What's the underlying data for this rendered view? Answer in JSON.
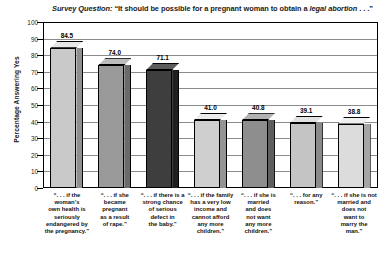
{
  "chart_data": {
    "type": "bar",
    "title_parts": {
      "lead_italic": "Survey Question:",
      "plain_1": " “It should be possible for a pregnant woman to obtain a ",
      "emph_italic": "legal abortion",
      "plain_2": " . . .”"
    },
    "xlabel": "",
    "ylabel": "Percentage Answering Yes",
    "ylim": [
      0,
      100
    ],
    "ytick_step": 10,
    "yticks": [
      100,
      90,
      80,
      70,
      60,
      50,
      40,
      30,
      20,
      10,
      0
    ],
    "grid": true,
    "legend": "none",
    "categories": [
      "“. . . if the woman’s own health is seriously endangered by the pregnancy.”",
      "“. . . if she became pregnant as a result of rape.”",
      "“. . . if there is a strong chance of serious defect in the baby.”",
      "“. . . if the family has a very low income and cannot afford any more children.”",
      "“. . . if she is married and does not want any more children.”",
      "“. . . for any reason.”",
      "“. . . if she is not married and does not want to marry the man.”"
    ],
    "category_lines": [
      [
        "“. . . if the",
        "woman’s",
        "own health is",
        "seriously",
        "endangered by",
        "the pregnancy.”"
      ],
      [
        "“. . . if she",
        "became",
        "pregnant",
        "as a result",
        "of rape.”"
      ],
      [
        "“. . . if there is a",
        "strong chance",
        "of serious",
        "defect in",
        "the baby.”"
      ],
      [
        "“. . . if the family",
        "has a very low",
        "income and",
        "cannot afford",
        "any more",
        "children.”"
      ],
      [
        "“. . . if she is",
        "married",
        "and does",
        "not want",
        "any more",
        "children.”"
      ],
      [
        "“. . . for any",
        "reason.”"
      ],
      [
        "“. . . if she is not",
        "married and",
        "does not",
        "want to",
        "marry the",
        "man.”"
      ]
    ],
    "values": [
      84.5,
      74.0,
      71.1,
      41.0,
      40.8,
      39.1,
      38.8
    ],
    "value_labels": [
      "84.5",
      "74.0",
      "71.1",
      "41.0",
      "40.8",
      "39.1",
      "38.8"
    ],
    "bar_colors": [
      "#c9c9c9",
      "#9a9a9a",
      "#3e3e3e",
      "#cfcfcf",
      "#8e8e8e",
      "#c4c4c4",
      "#dcdcdc"
    ],
    "bar_side_colors": [
      "#8f8f8f",
      "#6a6a6a",
      "#1f1f1f",
      "#949494",
      "#5e5e5e",
      "#8a8a8a",
      "#a5a5a5"
    ],
    "bar_top_colors": [
      "#e6e6e6",
      "#bdbdbd",
      "#5c5c5c",
      "#ececec",
      "#b2b2b2",
      "#e1e1e1",
      "#f0f0f0"
    ]
  }
}
